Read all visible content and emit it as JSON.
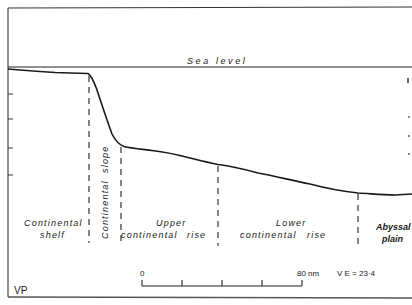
{
  "diagram": {
    "sea_level_label": "Sea  level",
    "corner_label": "VP",
    "zones": [
      {
        "line1": "Continental",
        "line2": "shelf"
      },
      {
        "line1": "Continental",
        "line2": "slope"
      },
      {
        "line1": "Upper",
        "line2": "continental",
        "line3": "rise"
      },
      {
        "line1": "Lower",
        "line2": "continental",
        "line3": "rise"
      },
      {
        "line1": "Abyssal",
        "line2": "plain"
      }
    ],
    "scale_bar": {
      "start_label": "0",
      "end_label": "80 nm",
      "divisions": 4
    },
    "vertical_exaggeration": "V E = 23·4",
    "colors": {
      "line": "#1a1a1a",
      "background": "#ffffff",
      "frame": "#555555"
    }
  }
}
